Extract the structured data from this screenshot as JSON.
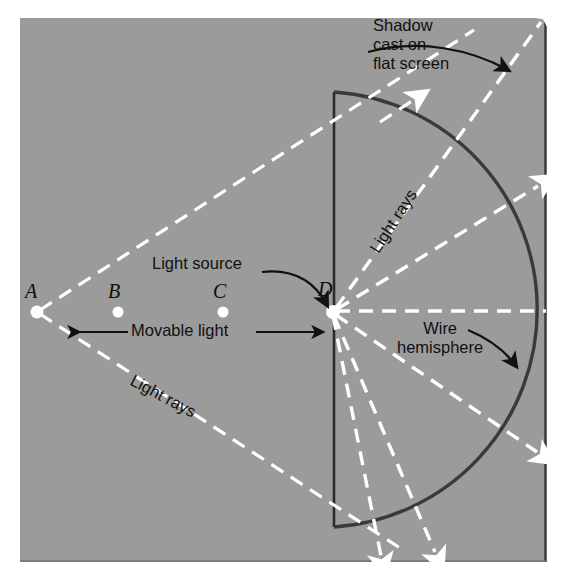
{
  "figure": {
    "background_color": "#9b9b9b",
    "ray_color": "#ffffff",
    "ink_color": "#111111",
    "arc_color": "#333333"
  },
  "points": [
    {
      "name": "point-a",
      "label": "A",
      "x": 37,
      "y": 312
    },
    {
      "name": "point-b",
      "label": "B",
      "x": 118,
      "y": 312
    },
    {
      "name": "point-c",
      "label": "C",
      "x": 223,
      "y": 312
    },
    {
      "name": "point-d",
      "label": "D",
      "x": 333,
      "y": 312
    }
  ],
  "annotations": {
    "shadow": "Shadow\ncast on\nflat screen",
    "light_source": "Light source",
    "movable_light": "Movable light",
    "wire_hemisphere": "Wire\nhemisphere",
    "light_rays_upper": "Light rays",
    "light_rays_lower": "Light rays"
  }
}
